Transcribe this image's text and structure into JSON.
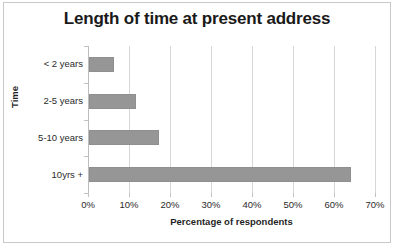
{
  "chart_data": {
    "type": "bar",
    "orientation": "horizontal",
    "title": "Length of time at present address",
    "xlabel": "Percentage of respondents",
    "ylabel": "Time",
    "categories": [
      "< 2 years",
      "2-5 years",
      "5-10 years",
      "10yrs +"
    ],
    "values": [
      6,
      11.5,
      17,
      64
    ],
    "xlim": [
      0,
      70
    ],
    "xticks": [
      0,
      10,
      20,
      30,
      40,
      50,
      60,
      70
    ],
    "xtick_labels": [
      "0%",
      "10%",
      "20%",
      "30%",
      "40%",
      "50%",
      "60%",
      "70%"
    ],
    "grid": true,
    "gridlines": "vertical",
    "legend": false,
    "series_color": "#969696",
    "gridline_color": "#d6d6d6",
    "border_color": "#c9c9c9",
    "text_color": "#1a1a1a"
  }
}
